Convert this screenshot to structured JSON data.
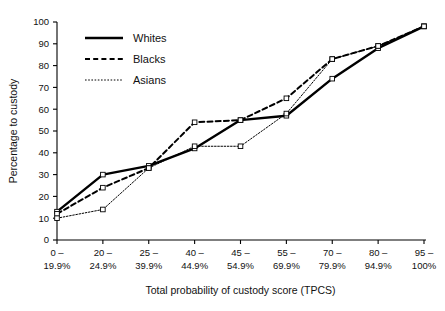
{
  "chart_data": {
    "type": "line",
    "title": "",
    "xlabel": "Total probability of custody score (TPCS)",
    "ylabel": "Percentage to custody",
    "categories": [
      "0 –\n19.9%",
      "20 –\n24.9%",
      "25 –\n39.9%",
      "40 –\n44.9%",
      "45 –\n54.9%",
      "55 –\n69.9%",
      "70 –\n79.9%",
      "80 –\n94.9%",
      "95 –\n100%"
    ],
    "category_top": [
      "0 –",
      "20 –",
      "25 –",
      "40 –",
      "45 –",
      "55 –",
      "70 –",
      "80 –",
      "95 –"
    ],
    "category_bottom": [
      "19.9%",
      "24.9%",
      "39.9%",
      "44.9%",
      "54.9%",
      "69.9%",
      "79.9%",
      "94.9%",
      "100%"
    ],
    "ylim": [
      0,
      100
    ],
    "yticks": [
      0,
      10,
      20,
      30,
      40,
      50,
      60,
      70,
      80,
      90,
      100
    ],
    "grid": false,
    "legend_position": "top-left",
    "series": [
      {
        "name": "Whites",
        "style": "solid",
        "values": [
          13,
          30,
          34,
          42,
          55,
          57,
          74,
          88,
          98
        ]
      },
      {
        "name": "Blacks",
        "style": "dashed",
        "values": [
          12,
          24,
          33,
          54,
          55,
          65,
          83,
          89,
          98
        ]
      },
      {
        "name": "Asians",
        "style": "dotted",
        "values": [
          10,
          14,
          33,
          43,
          43,
          58,
          83,
          89,
          98
        ]
      }
    ]
  },
  "legend": {
    "items": [
      {
        "label": "Whites",
        "style": "solid"
      },
      {
        "label": "Blacks",
        "style": "dashed"
      },
      {
        "label": "Asians",
        "style": "dotted"
      }
    ]
  },
  "colors": {
    "line": "#000000",
    "text": "#111111",
    "background": "#ffffff"
  }
}
